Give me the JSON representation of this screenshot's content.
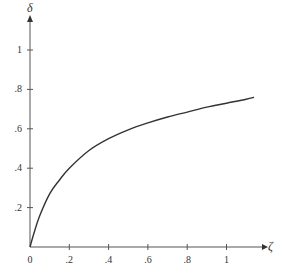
{
  "chart_data": {
    "type": "line",
    "title": "",
    "xlabel": "ζ",
    "ylabel": "δ",
    "xlim": [
      0,
      1.2
    ],
    "ylim": [
      0,
      1.1
    ],
    "grid": false,
    "x_ticks": [
      "0",
      ".2",
      ".4",
      ".6",
      ".8",
      "1"
    ],
    "y_ticks": [
      ".2",
      ".4",
      ".6",
      ".8",
      "1"
    ],
    "series": [
      {
        "name": "δ(ζ)",
        "x": [
          0,
          0.02,
          0.05,
          0.1,
          0.15,
          0.2,
          0.3,
          0.4,
          0.5,
          0.6,
          0.7,
          0.8,
          0.9,
          1.0,
          1.1,
          1.14
        ],
        "values": [
          0,
          0.07,
          0.16,
          0.27,
          0.34,
          0.4,
          0.49,
          0.55,
          0.595,
          0.63,
          0.66,
          0.685,
          0.71,
          0.73,
          0.75,
          0.76
        ]
      }
    ],
    "colors": {
      "line": "#333333",
      "axis": "#555555"
    }
  }
}
